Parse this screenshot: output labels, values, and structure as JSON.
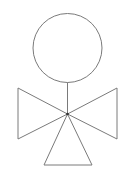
{
  "figure": {
    "colors": {
      "stroke": "#7a7a7a",
      "center_dot": "#333333",
      "background": "#ffffff"
    },
    "parts": [
      "head-circle",
      "neck-line",
      "left-triangle",
      "right-triangle",
      "bottom-triangle",
      "center-dot"
    ]
  }
}
